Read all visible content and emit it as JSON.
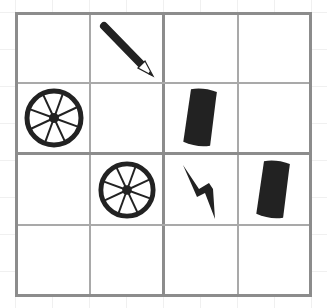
{
  "puzzle": {
    "type": "4x4 picture sudoku",
    "rows": 4,
    "cols": 4,
    "box_size": 2,
    "colors": {
      "border": "#8c8c8c",
      "thin_line": "#a9a9a9",
      "icon": "#222222",
      "background_grid": "#f0f0f0"
    },
    "cells": [
      [
        "",
        "pencil",
        "",
        ""
      ],
      [
        "wheel",
        "",
        "cylinder",
        ""
      ],
      [
        "",
        "wheel",
        "lightning",
        "cylinder"
      ],
      [
        "",
        "",
        "",
        ""
      ]
    ]
  }
}
